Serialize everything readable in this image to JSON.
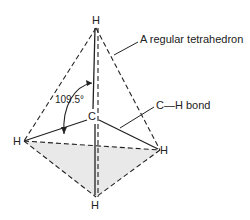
{
  "diagram": {
    "atoms": {
      "top": "H",
      "center": "C",
      "left": "H",
      "right": "H",
      "bottom": "H"
    },
    "angle_label": "109.5°",
    "callouts": {
      "tetrahedron": "A regular tetrahedron",
      "bond": "C—H bond"
    },
    "colors": {
      "line": "#222222",
      "face_fill": "#e8e8e8"
    }
  }
}
